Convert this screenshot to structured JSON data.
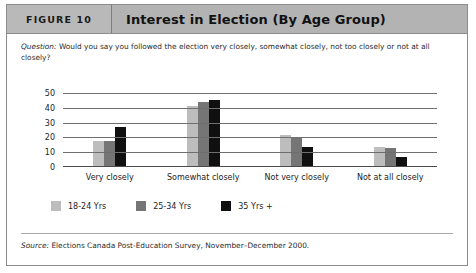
{
  "figure": {
    "number_label": "FIGURE 10",
    "title": "Interest in Election (By Age Group)"
  },
  "question": {
    "label": "Question:",
    "text": " Would you say you followed the election very closely, somewhat closely, not too closely or not at all closely?"
  },
  "source": {
    "label": "Source:",
    "text": " Elections Canada Post-Education Survey, November–December 2000."
  },
  "colors": {
    "series_18_24": "#bdbdbd",
    "series_25_34": "#757575",
    "series_35_plus": "#101010",
    "header_bg": "#b3b3b3",
    "border": "#8c8c8c"
  },
  "chart_data": {
    "type": "bar",
    "title": "Interest in Election (By Age Group)",
    "xlabel": "",
    "ylabel": "",
    "ylim": [
      0,
      50
    ],
    "yticks": [
      50,
      40,
      30,
      20,
      10,
      0
    ],
    "grid": true,
    "legend_position": "bottom-left",
    "categories": [
      "Very closely",
      "Somewhat closely",
      "Not very closely",
      "Not at all closely"
    ],
    "series": [
      {
        "name": "18-24 Yrs",
        "color": "#bdbdbd",
        "values": [
          17,
          41,
          21,
          13
        ]
      },
      {
        "name": "25-34 Yrs",
        "color": "#757575",
        "values": [
          17,
          44,
          19,
          12
        ]
      },
      {
        "name": "35 Yrs +",
        "color": "#101010",
        "values": [
          27,
          45,
          13,
          6
        ]
      }
    ]
  }
}
